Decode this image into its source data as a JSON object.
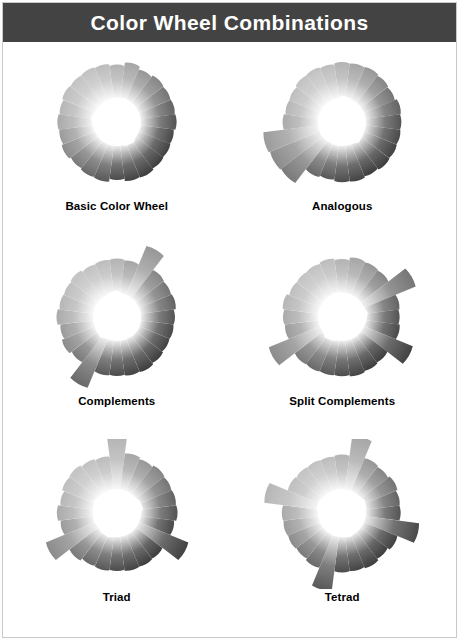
{
  "page": {
    "background_color": "#ffffff",
    "frame_color": "#c9c9c9"
  },
  "header": {
    "title": "Color Wheel Combinations",
    "background_color": "#434343",
    "text_color": "#ffffff"
  },
  "chart_data": {
    "type": "pie",
    "title": "Color Wheel Combinations",
    "xlabel": "",
    "ylabel": "",
    "layout": {
      "rows": 3,
      "columns": 2,
      "legend": "none",
      "grid": false
    },
    "spoke_count": 24,
    "categories": [
      "Basic Color Wheel",
      "Analogous",
      "Complements",
      "Split Complements",
      "Triad",
      "Tetrad"
    ],
    "values": [
      0,
      3,
      2,
      3,
      3,
      4
    ],
    "series": [
      {
        "name": "selected spokes per scheme",
        "values": [
          0,
          3,
          2,
          3,
          3,
          4
        ]
      }
    ]
  },
  "wheels": [
    {
      "id": "basic-color-wheel",
      "label": "Basic Color Wheel",
      "selected_spokes": [],
      "extension": 0
    },
    {
      "id": "analogous",
      "label": "Analogous",
      "selected_spokes": [
        15,
        16,
        17
      ],
      "extension": 20
    },
    {
      "id": "complements",
      "label": "Complements",
      "selected_spokes": [
        2,
        14
      ],
      "extension": 20
    },
    {
      "id": "split-complements",
      "label": "Split Complements",
      "selected_spokes": [
        16,
        4,
        8
      ],
      "extension": 20
    },
    {
      "id": "triad",
      "label": "Triad",
      "selected_spokes": [
        0,
        8,
        16
      ],
      "extension": 20
    },
    {
      "id": "tetrad",
      "label": "Tetrad",
      "selected_spokes": [
        1,
        7,
        13,
        19
      ],
      "extension": 20
    }
  ]
}
